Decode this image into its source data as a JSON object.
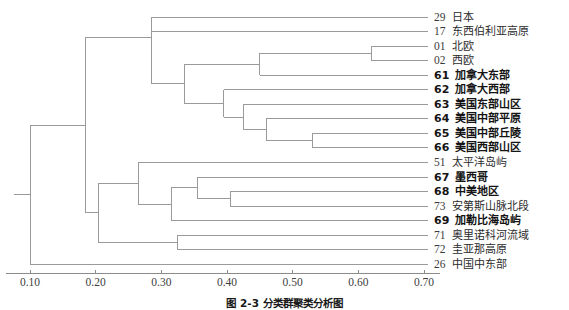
{
  "figure": {
    "type": "dendrogram",
    "caption": "图 2-3  分类群聚类分析图"
  },
  "axis": {
    "label": "",
    "ticks": [
      "0.10",
      "0.20",
      "0.30",
      "0.40",
      "0.50",
      "0.60",
      "0.70"
    ],
    "tick_values": [
      0.1,
      0.2,
      0.3,
      0.4,
      0.5,
      0.6,
      0.7
    ],
    "range": [
      0.065,
      0.74
    ],
    "line_color": "#8c8c8c"
  },
  "leaves": [
    {
      "code": "29",
      "name": "日本",
      "bold": false
    },
    {
      "code": "17",
      "name": "东西伯利亚高原",
      "bold": false
    },
    {
      "code": "01",
      "name": "北欧",
      "bold": false
    },
    {
      "code": "02",
      "name": "西欧",
      "bold": false
    },
    {
      "code": "61",
      "name": "加拿大东部",
      "bold": true
    },
    {
      "code": "62",
      "name": "加拿大西部",
      "bold": true
    },
    {
      "code": "63",
      "name": "美国东部山区",
      "bold": true
    },
    {
      "code": "64",
      "name": "美国中部平原",
      "bold": true
    },
    {
      "code": "65",
      "name": "美国中部丘陵",
      "bold": true
    },
    {
      "code": "66",
      "name": "美国西部山区",
      "bold": true
    },
    {
      "code": "51",
      "name": "太平洋岛屿",
      "bold": false
    },
    {
      "code": "67",
      "name": "墨西哥",
      "bold": true
    },
    {
      "code": "68",
      "name": "中美地区",
      "bold": true
    },
    {
      "code": "73",
      "name": "安第斯山脉北段",
      "bold": false
    },
    {
      "code": "69",
      "name": "加勒比海岛屿",
      "bold": true
    },
    {
      "code": "71",
      "name": "奥里诺科河流域",
      "bold": false
    },
    {
      "code": "72",
      "name": "圭亚那高原",
      "bold": false
    },
    {
      "code": "26",
      "name": "中国中东部",
      "bold": false
    }
  ],
  "chart_data": {
    "type": "dendrogram",
    "title": "图 2-3  分类群聚类分析图",
    "xlabel": "",
    "ylabel": "",
    "xlim": [
      0.065,
      0.74
    ],
    "grid": false,
    "orientation": "horizontal-right-leaves",
    "leaf_order": [
      "29",
      "17",
      "01",
      "02",
      "61",
      "62",
      "63",
      "64",
      "65",
      "66",
      "51",
      "67",
      "68",
      "73",
      "69",
      "71",
      "72",
      "26"
    ],
    "leaf_labels": [
      "日本",
      "东西伯利亚高原",
      "北欧",
      "西欧",
      "加拿大东部",
      "加拿大西部",
      "美国东部山区",
      "美国中部平原",
      "美国中部丘陵",
      "美国西部山区",
      "太平洋岛屿",
      "墨西哥",
      "中美地区",
      "安第斯山脉北段",
      "加勒比海岛屿",
      "奥里诺科河流域",
      "圭亚那高原",
      "中国中东部"
    ],
    "merges": [
      {
        "id": "n1",
        "children": [
          "01",
          "02"
        ],
        "distance": 0.62
      },
      {
        "id": "n2",
        "children": [
          "61",
          "n1"
        ],
        "distance": 0.45
      },
      {
        "id": "n3",
        "children": [
          "65",
          "66"
        ],
        "distance": 0.53
      },
      {
        "id": "n4",
        "children": [
          "64",
          "n3"
        ],
        "distance": 0.46
      },
      {
        "id": "n5",
        "children": [
          "63",
          "n4"
        ],
        "distance": 0.425
      },
      {
        "id": "n6",
        "children": [
          "62",
          "n5"
        ],
        "distance": 0.395
      },
      {
        "id": "n7",
        "children": [
          "n2",
          "n6"
        ],
        "distance": 0.335
      },
      {
        "id": "n8",
        "children": [
          "17",
          "n7"
        ],
        "distance": 0.285
      },
      {
        "id": "n9",
        "children": [
          "29",
          "n8"
        ],
        "distance": 0.285
      },
      {
        "id": "n10",
        "children": [
          "68",
          "73"
        ],
        "distance": 0.405
      },
      {
        "id": "n11",
        "children": [
          "67",
          "n10"
        ],
        "distance": 0.355
      },
      {
        "id": "n12",
        "children": [
          "n11",
          "69"
        ],
        "distance": 0.315
      },
      {
        "id": "n13",
        "children": [
          "71",
          "72"
        ],
        "distance": 0.325
      },
      {
        "id": "n14",
        "children": [
          "51",
          "n12"
        ],
        "distance": 0.265
      },
      {
        "id": "n15",
        "children": [
          "n14",
          "n13"
        ],
        "distance": 0.205
      },
      {
        "id": "n16",
        "children": [
          "n9",
          "n15"
        ],
        "distance": 0.185
      },
      {
        "id": "root",
        "children": [
          "n16",
          "26"
        ],
        "distance": 0.1
      }
    ],
    "line_color": "#9a9a9a",
    "n_leaves": 18
  }
}
